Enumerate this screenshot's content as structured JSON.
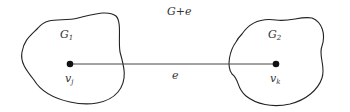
{
  "diagram": {
    "title": "G+e",
    "edge_label": "e",
    "left_graph": {
      "label": "G",
      "subscript": "1",
      "vertex": "v",
      "vertex_sub": "j"
    },
    "right_graph": {
      "label": "G",
      "subscript": "2",
      "vertex": "v",
      "vertex_sub": "k"
    },
    "colors": {
      "stroke": "#222222",
      "text": "#333333",
      "background": "#ffffff"
    }
  }
}
